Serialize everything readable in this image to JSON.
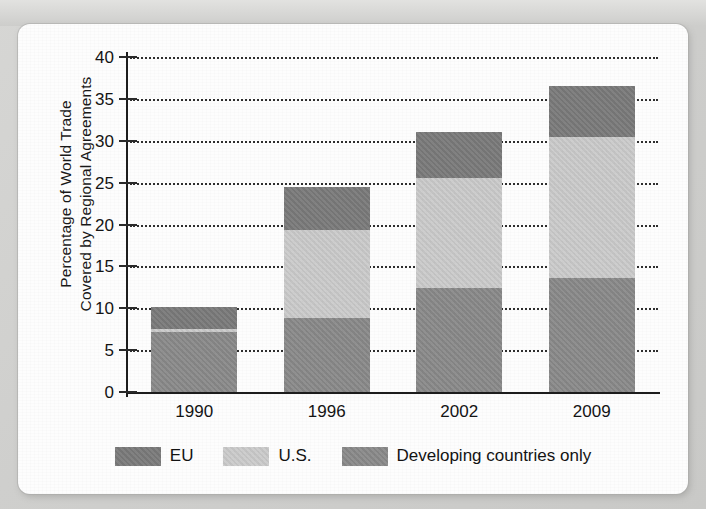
{
  "chart_data": {
    "type": "bar",
    "stacked": true,
    "title": "",
    "xlabel": "",
    "ylabel": "Percentage of World Trade Covered by Regional Agreements",
    "ylabel_line1": "Percentage of World Trade",
    "ylabel_line2": "Covered by Regional Agreements",
    "categories": [
      "1990",
      "1996",
      "2002",
      "2009"
    ],
    "ylim": [
      0,
      40
    ],
    "ytick_step": 5,
    "yticks": [
      "0",
      "5",
      "10",
      "15",
      "20",
      "25",
      "30",
      "35",
      "40"
    ],
    "grid": "horizontal-dotted",
    "legend_position": "bottom",
    "series": [
      {
        "name": "Developing countries only",
        "color": "#8b8b8b",
        "values": [
          7.2,
          8.8,
          12.4,
          13.6
        ]
      },
      {
        "name": "U.S.",
        "color": "#cbcbcb",
        "values": [
          0.3,
          10.5,
          13.1,
          16.8
        ]
      },
      {
        "name": "EU",
        "color": "#7b7b7b",
        "values": [
          2.6,
          5.2,
          5.5,
          6.1
        ]
      }
    ],
    "stack_order_bottom_to_top": [
      "Developing countries only",
      "U.S.",
      "EU"
    ],
    "totals": [
      10.1,
      24.5,
      31.0,
      36.5
    ]
  },
  "legend": {
    "items": [
      {
        "label": "EU",
        "swatch": "eu"
      },
      {
        "label": "U.S.",
        "swatch": "us"
      },
      {
        "label": "Developing countries only",
        "swatch": "dev"
      }
    ]
  },
  "colors": {
    "eu": "#7b7b7b",
    "us": "#cbcbcb",
    "developing": "#8b8b8b",
    "axis": "#1d1d1d",
    "page_background": "#cfcfcd",
    "card_background": "#fdfdfd"
  }
}
